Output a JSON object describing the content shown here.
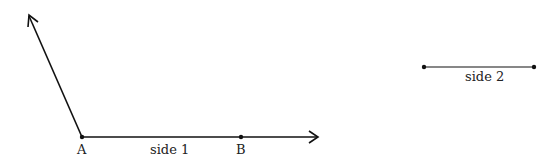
{
  "diagram": {
    "points": {
      "A": {
        "label": "A"
      },
      "B": {
        "label": "B"
      }
    },
    "labels": {
      "side1": "side 1",
      "side2": "side 2"
    },
    "stroke_color": "#111111"
  }
}
